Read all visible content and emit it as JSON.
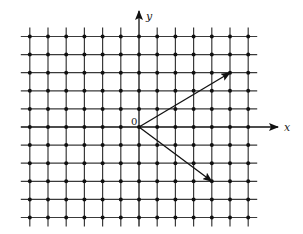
{
  "diagram": {
    "type": "lattice-with-vectors",
    "colors": {
      "grid": "#3a3a3a",
      "point": "#111111",
      "axis": "#111111",
      "vector": "#111111",
      "background": "#ffffff"
    },
    "grid": {
      "origin_px": [
        139,
        127
      ],
      "spacing_px": [
        18.2,
        18.1
      ],
      "i_range": [
        -6,
        6
      ],
      "j_range": [
        -5,
        5
      ]
    },
    "axes": {
      "x_label": "x",
      "y_label": "y",
      "origin_label": "0"
    },
    "vectors": [
      {
        "name": "vector-a",
        "from": [
          0,
          0
        ],
        "to": [
          5,
          3
        ]
      },
      {
        "name": "vector-b",
        "from": [
          0,
          0
        ],
        "to": [
          4,
          -3
        ]
      }
    ]
  }
}
